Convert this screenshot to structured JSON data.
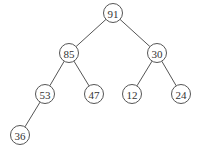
{
  "diagram": {
    "type": "binary-tree (max-heap)",
    "nodes": [
      {
        "id": "n91",
        "label": "91",
        "x": 113,
        "y": 13
      },
      {
        "id": "n85",
        "label": "85",
        "x": 69,
        "y": 53
      },
      {
        "id": "n30",
        "label": "30",
        "x": 157,
        "y": 53
      },
      {
        "id": "n53",
        "label": "53",
        "x": 45,
        "y": 94
      },
      {
        "id": "n47",
        "label": "47",
        "x": 94,
        "y": 94
      },
      {
        "id": "n12",
        "label": "12",
        "x": 132,
        "y": 94
      },
      {
        "id": "n24",
        "label": "24",
        "x": 181,
        "y": 94
      },
      {
        "id": "n36",
        "label": "36",
        "x": 20,
        "y": 135
      }
    ],
    "edges": [
      [
        "n91",
        "n85"
      ],
      [
        "n91",
        "n30"
      ],
      [
        "n85",
        "n53"
      ],
      [
        "n85",
        "n47"
      ],
      [
        "n30",
        "n12"
      ],
      [
        "n30",
        "n24"
      ],
      [
        "n53",
        "n36"
      ]
    ],
    "node_radius": 9.5
  }
}
